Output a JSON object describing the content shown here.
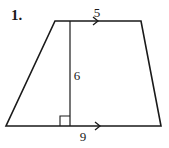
{
  "problem": {
    "number": "1.",
    "shape": "trapezoid",
    "labels": {
      "top_base": "5",
      "height": "6",
      "bottom_base": "9"
    },
    "colors": {
      "stroke": "#1a1a1a",
      "background": "#ffffff"
    }
  }
}
